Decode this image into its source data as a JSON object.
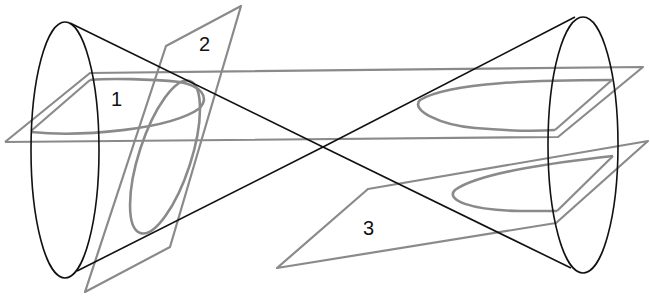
{
  "diagram": {
    "labels": [
      {
        "id": "1",
        "text": "1",
        "x": 111,
        "y": 89
      },
      {
        "id": "2",
        "text": "2",
        "x": 199,
        "y": 34
      },
      {
        "id": "3",
        "text": "3",
        "x": 363,
        "y": 218
      }
    ],
    "colors": {
      "cone": "#111111",
      "planes": "#8a8a8a",
      "background": "#ffffff"
    }
  }
}
